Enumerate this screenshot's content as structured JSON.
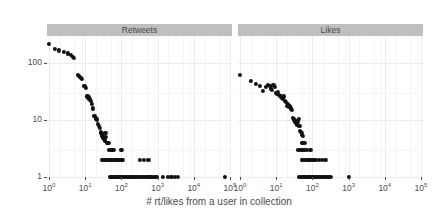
{
  "chart_data": {
    "type": "scatter",
    "title": "",
    "xlabel": "# rt/likes from a user in collection",
    "ylabel": "# Tweets",
    "xscale": "log10",
    "yscale": "log10",
    "xlim": [
      1,
      100000
    ],
    "ylim": [
      1,
      300
    ],
    "xticks": [
      "10^0",
      "10^1",
      "10^2",
      "10^3",
      "10^4",
      "10^5"
    ],
    "xtick_labels": [
      "10",
      "10",
      "10",
      "10",
      "10",
      "10"
    ],
    "xtick_exponents": [
      "0",
      "1",
      "2",
      "3",
      "4",
      "5"
    ],
    "yticks": [
      1,
      10,
      100
    ],
    "ytick_labels": [
      "1",
      "10",
      "100"
    ],
    "grid": true,
    "legend": "none",
    "point_color": "#111111",
    "strip_fill": "#bfbfbf",
    "panel_fill": "#ffffff",
    "grid_color": "#ececec",
    "facets": [
      {
        "label": "Retweets",
        "points": [
          [
            1.0,
            215
          ],
          [
            1.45,
            180
          ],
          [
            1.9,
            168
          ],
          [
            2.6,
            160
          ],
          [
            3.3,
            148
          ],
          [
            4.0,
            140
          ],
          [
            4.6,
            128
          ],
          [
            4.9,
            124
          ],
          [
            6.3,
            62
          ],
          [
            6.8,
            60
          ],
          [
            7.3,
            57
          ],
          [
            7.8,
            55
          ],
          [
            8.2,
            53
          ],
          [
            9.5,
            40
          ],
          [
            10.5,
            37
          ],
          [
            11.5,
            26
          ],
          [
            12.2,
            25
          ],
          [
            12.8,
            24
          ],
          [
            13.5,
            23
          ],
          [
            14.2,
            22
          ],
          [
            15.5,
            19
          ],
          [
            16.5,
            16
          ],
          [
            18.0,
            12
          ],
          [
            19.5,
            11
          ],
          [
            20.5,
            10.5
          ],
          [
            21.5,
            10
          ],
          [
            23.0,
            8.5
          ],
          [
            24.0,
            8
          ],
          [
            25.0,
            7.2
          ],
          [
            26.5,
            6.2
          ],
          [
            27.5,
            6.0
          ],
          [
            28.5,
            5.6
          ],
          [
            30.0,
            5.3
          ],
          [
            31.0,
            5.0
          ],
          [
            32.0,
            4.8
          ],
          [
            33.5,
            4.6
          ],
          [
            35.0,
            4.4
          ],
          [
            36.0,
            6.0
          ],
          [
            38.0,
            5.0
          ],
          [
            40.0,
            4.0
          ],
          [
            42.0,
            4.0
          ],
          [
            44.0,
            4.0
          ],
          [
            46.0,
            3.0
          ],
          [
            50.0,
            3.0
          ],
          [
            54.0,
            3.0
          ],
          [
            58.0,
            3.0
          ],
          [
            62.0,
            3.0
          ],
          [
            100.0,
            3.0
          ],
          [
            30.0,
            2.0
          ],
          [
            33.0,
            2.0
          ],
          [
            36.0,
            2.0
          ],
          [
            40.0,
            2.0
          ],
          [
            44.0,
            2.0
          ],
          [
            48.0,
            2.0
          ],
          [
            52.0,
            2.0
          ],
          [
            56.0,
            2.0
          ],
          [
            62.0,
            2.0
          ],
          [
            68.0,
            2.0
          ],
          [
            75.0,
            2.0
          ],
          [
            82.0,
            2.0
          ],
          [
            90.0,
            2.0
          ],
          [
            100.0,
            2.0
          ],
          [
            110.0,
            2.0
          ],
          [
            330.0,
            2.0
          ],
          [
            420.0,
            2.0
          ],
          [
            560.0,
            2.0
          ],
          [
            48.0,
            1.0
          ],
          [
            52.0,
            1.0
          ],
          [
            56.0,
            1.0
          ],
          [
            60.0,
            1.0
          ],
          [
            65.0,
            1.0
          ],
          [
            70.0,
            1.0
          ],
          [
            76.0,
            1.0
          ],
          [
            82.0,
            1.0
          ],
          [
            88.0,
            1.0
          ],
          [
            95.0,
            1.0
          ],
          [
            105.0,
            1.0
          ],
          [
            115.0,
            1.0
          ],
          [
            125.0,
            1.0
          ],
          [
            140.0,
            1.0
          ],
          [
            155.0,
            1.0
          ],
          [
            170.0,
            1.0
          ],
          [
            190.0,
            1.0
          ],
          [
            210.0,
            1.0
          ],
          [
            235.0,
            1.0
          ],
          [
            260.0,
            1.0
          ],
          [
            290.0,
            1.0
          ],
          [
            320.0,
            1.0
          ],
          [
            360.0,
            1.0
          ],
          [
            400.0,
            1.0
          ],
          [
            450.0,
            1.0
          ],
          [
            500.0,
            1.0
          ],
          [
            560.0,
            1.0
          ],
          [
            630.0,
            1.0
          ],
          [
            700.0,
            1.0
          ],
          [
            790.0,
            1.0
          ],
          [
            880.0,
            1.0
          ],
          [
            980.0,
            1.0
          ],
          [
            1400.0,
            1.0
          ],
          [
            1900.0,
            1.0
          ],
          [
            2400.0,
            1.0
          ],
          [
            3000.0,
            1.0
          ],
          [
            3700.0,
            1.0
          ],
          [
            72000.0,
            1.0
          ]
        ]
      },
      {
        "label": "Likes",
        "points": [
          [
            1.0,
            62
          ],
          [
            2.0,
            48
          ],
          [
            2.8,
            43
          ],
          [
            3.6,
            40
          ],
          [
            4.4,
            33
          ],
          [
            5.2,
            38
          ],
          [
            6.0,
            42
          ],
          [
            6.6,
            40
          ],
          [
            7.2,
            36
          ],
          [
            7.8,
            34
          ],
          [
            8.4,
            41
          ],
          [
            9.0,
            38
          ],
          [
            9.6,
            30
          ],
          [
            10.4,
            29
          ],
          [
            11.2,
            31
          ],
          [
            12.0,
            28
          ],
          [
            12.8,
            27
          ],
          [
            13.6,
            26
          ],
          [
            14.4,
            25
          ],
          [
            15.4,
            24
          ],
          [
            16.4,
            26
          ],
          [
            17.4,
            22
          ],
          [
            18.4,
            21
          ],
          [
            20.0,
            18
          ],
          [
            21.5,
            19
          ],
          [
            23.0,
            17
          ],
          [
            24.5,
            18
          ],
          [
            26.0,
            16
          ],
          [
            27.5,
            15
          ],
          [
            29.0,
            11
          ],
          [
            30.5,
            10.5
          ],
          [
            32.0,
            10
          ],
          [
            33.5,
            9.5
          ],
          [
            35.0,
            9.0
          ],
          [
            36.5,
            8.6
          ],
          [
            38.0,
            8.2
          ],
          [
            40.0,
            9.5
          ],
          [
            42.0,
            10.5
          ],
          [
            44.0,
            8.0
          ],
          [
            46.0,
            6.5
          ],
          [
            48.0,
            6.2
          ],
          [
            50.0,
            6.0
          ],
          [
            52.0,
            5.5
          ],
          [
            54.0,
            5.2
          ],
          [
            50.0,
            4.0
          ],
          [
            56.0,
            4.0
          ],
          [
            62.0,
            4.0
          ],
          [
            40.0,
            3.0
          ],
          [
            45.0,
            3.0
          ],
          [
            50.0,
            3.0
          ],
          [
            56.0,
            3.0
          ],
          [
            62.0,
            3.0
          ],
          [
            70.0,
            3.0
          ],
          [
            88.0,
            3.0
          ],
          [
            50.0,
            2.0
          ],
          [
            56.0,
            2.0
          ],
          [
            62.0,
            2.0
          ],
          [
            70.0,
            2.0
          ],
          [
            78.0,
            2.0
          ],
          [
            86.0,
            2.0
          ],
          [
            95.0,
            2.0
          ],
          [
            105.0,
            2.0
          ],
          [
            115.0,
            2.0
          ],
          [
            128.0,
            2.0
          ],
          [
            150.0,
            2.0
          ],
          [
            180.0,
            2.0
          ],
          [
            230.0,
            2.0
          ],
          [
            42.0,
            1.0
          ],
          [
            46.0,
            1.0
          ],
          [
            50.0,
            1.0
          ],
          [
            55.0,
            1.0
          ],
          [
            60.0,
            1.0
          ],
          [
            66.0,
            1.0
          ],
          [
            72.0,
            1.0
          ],
          [
            79.0,
            1.0
          ],
          [
            86.0,
            1.0
          ],
          [
            94.0,
            1.0
          ],
          [
            103.0,
            1.0
          ],
          [
            113.0,
            1.0
          ],
          [
            124.0,
            1.0
          ],
          [
            136.0,
            1.0
          ],
          [
            150.0,
            1.0
          ],
          [
            165.0,
            1.0
          ],
          [
            182.0,
            1.0
          ],
          [
            200.0,
            1.0
          ],
          [
            220.0,
            1.0
          ],
          [
            242.0,
            1.0
          ],
          [
            266.0,
            1.0
          ],
          [
            292.0,
            1.0
          ],
          [
            320.0,
            1.0
          ],
          [
            1000.0,
            1.0
          ]
        ]
      }
    ]
  }
}
